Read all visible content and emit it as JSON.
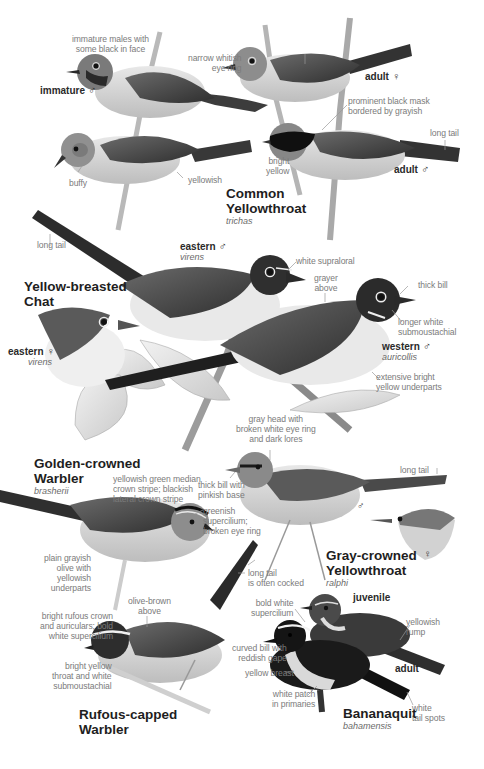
{
  "species": [
    {
      "common_name_line1": "Common",
      "common_name_line2": "Yellowthroat",
      "subspecies": "trichas",
      "figures": [
        {
          "label": "immature",
          "sex_symbol": "♂"
        },
        {
          "label": "adult",
          "sex_symbol": "♀"
        },
        {
          "label": "adult",
          "sex_symbol": "♂"
        }
      ],
      "annotations": [
        "immature males with some black in face",
        "narrow whitish eye ring",
        "prominent black mask bordered by grayish",
        "long tail",
        "bright yellow",
        "buffy",
        "yellowish"
      ]
    },
    {
      "common_name_line1": "Yellow-breasted",
      "common_name_line2": "Chat",
      "figures": [
        {
          "label": "eastern",
          "sex_symbol": "♂",
          "subspecies": "virens"
        },
        {
          "label": "eastern",
          "sex_symbol": "♀",
          "subspecies": "virens"
        },
        {
          "label": "western",
          "sex_symbol": "♂",
          "subspecies": "auricollis"
        }
      ],
      "annotations": [
        "long tail",
        "white supraloral",
        "grayer above",
        "thick bill",
        "longer white submoustachial",
        "extensive bright yellow underparts"
      ]
    },
    {
      "common_name_line1": "Golden-crowned",
      "common_name_line2": "Warbler",
      "subspecies": "brasherii",
      "annotations": [
        "yellowish green median crown stripe; blackish lateral crown stripe",
        "greenish supercilium; broken eye ring",
        "plain grayish olive with yellowish underparts"
      ]
    },
    {
      "common_name_line1": "Gray-crowned",
      "common_name_line2": "Yellowthroat",
      "subspecies": "ralphi",
      "figures": [
        {
          "label": "",
          "sex_symbol": "♂"
        },
        {
          "label": "",
          "sex_symbol": "♀"
        }
      ],
      "annotations": [
        "gray head with broken white eye ring and dark lores",
        "thick bill with pinkish base",
        "long tail"
      ]
    },
    {
      "common_name_line1": "Rufous-capped",
      "common_name_line2": "Warbler",
      "annotations": [
        "olive-brown above",
        "long tail is often cocked",
        "bright rufous crown and auriculars; bold white supercilium",
        "bright yellow throat and white submoustachial"
      ]
    },
    {
      "common_name_line1": "Bananaquit",
      "subspecies": "bahamensis",
      "figures": [
        {
          "label": "juvenile",
          "sex_symbol": ""
        },
        {
          "label": "adult",
          "sex_symbol": ""
        }
      ],
      "annotations": [
        "bold white supercilium",
        "yellowish rump",
        "curved bill with reddish gape",
        "yellow breast",
        "white patch in primaries",
        "white tail spots"
      ]
    }
  ],
  "text": {
    "cy_immature_note_1": "immature males with",
    "cy_immature_note_2": "some black in face",
    "cy_immature_tag": "immature",
    "cy_eyering_1": "narrow whitish",
    "cy_eyering_2": "eye ring",
    "cy_adult_f_tag": "adult",
    "cy_mask_1": "prominent black mask",
    "cy_mask_2": "bordered by grayish",
    "cy_longtail": "long tail",
    "cy_bright_1": "bright",
    "cy_bright_2": "yellow",
    "cy_adult_m_tag": "adult",
    "cy_buffy": "buffy",
    "cy_yellowish": "yellowish",
    "cy_name_1": "Common",
    "cy_name_2": "Yellowthroat",
    "cy_sci": "trichas",
    "ybc_longtail": "long tail",
    "ybc_east_m_tag": "eastern",
    "ybc_east_m_sci": "virens",
    "ybc_supraloral": "white supraloral",
    "ybc_grayer_1": "grayer",
    "ybc_grayer_2": "above",
    "ybc_thickbill": "thick bill",
    "ybc_name_1": "Yellow-breasted",
    "ybc_name_2": "Chat",
    "ybc_submous_1": "longer white",
    "ybc_submous_2": "submoustachial",
    "ybc_east_f_tag": "eastern",
    "ybc_east_f_sci": "virens",
    "ybc_west_m_tag": "western",
    "ybc_west_m_sci": "auricollis",
    "ybc_under_1": "extensive bright",
    "ybc_under_2": "yellow underparts",
    "gcy_head_1": "gray head with",
    "gcy_head_2": "broken white eye ring",
    "gcy_head_3": "and dark lores",
    "gcw_name_1": "Golden-crowned",
    "gcw_name_2": "Warbler",
    "gcw_sci": "brasherii",
    "gcw_crown_1": "yellowish green median",
    "gcw_crown_2": "crown stripe; blackish",
    "gcw_crown_3": "lateral crown stripe",
    "gcy_bill_1": "thick bill with",
    "gcy_bill_2": "pinkish base",
    "gcy_longtail": "long tail",
    "gcw_super_1": "greenish",
    "gcw_super_2": "supercilium;",
    "gcw_super_3": "broken eye ring",
    "gcy_male": "♂",
    "gcy_female": "♀",
    "gcw_plain_1": "plain grayish",
    "gcw_plain_2": "olive with",
    "gcw_plain_3": "yellowish",
    "gcw_plain_4": "underparts",
    "gcy_name_1": "Gray-crowned",
    "gcy_name_2": "Yellowthroat",
    "gcy_sci": "ralphi",
    "rcw_olive_1": "olive-brown",
    "rcw_olive_2": "above",
    "rcw_cocked_1": "long tail",
    "rcw_cocked_2": "is often cocked",
    "bq_super_1": "bold white",
    "bq_super_2": "supercilium",
    "bq_juv_tag": "juvenile",
    "rcw_crown_1": "bright rufous crown",
    "rcw_crown_2": "and auriculars; bold",
    "rcw_crown_3": "white supercilium",
    "bq_rump_1": "yellowish",
    "bq_rump_2": "rump",
    "bq_bill_1": "curved bill with",
    "bq_bill_2": "reddish gape",
    "bq_breast": "yellow breast",
    "bq_adult_tag": "adult",
    "rcw_throat_1": "bright yellow",
    "rcw_throat_2": "throat and white",
    "rcw_throat_3": "submoustachial",
    "bq_patch_1": "white patch",
    "bq_patch_2": "in primaries",
    "bq_tail_1": "white",
    "bq_tail_2": "tail spots",
    "rcw_name_1": "Rufous-capped",
    "rcw_name_2": "Warbler",
    "bq_name": "Bananaquit",
    "bq_sci": "bahamensis",
    "male_symbol": "♂",
    "female_symbol": "♀"
  },
  "colors": {
    "background": "#ffffff",
    "label_gray": "#7b7b7b",
    "title_black": "#1e1e1e",
    "bird_dark": "#2b2b2b",
    "bird_mid": "#6e6e6e",
    "bird_light": "#d9d9d9"
  }
}
